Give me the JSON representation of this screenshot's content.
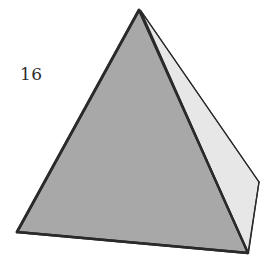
{
  "figure": {
    "kind": "geometry-solid-illustration",
    "shape_name": "tetrahedron",
    "label": "16",
    "label_position": {
      "x": 20,
      "y": 66
    },
    "canvas": {
      "width": 279,
      "height": 257,
      "background": "#ffffff"
    },
    "colors": {
      "background": "#ffffff",
      "front_face_fill": "#a8a8a8",
      "right_face_fill": "#e7e7e7",
      "edge_stroke": "#2a2a2a",
      "label_color": "#2b2b2b"
    },
    "vertices": {
      "apex": {
        "name": "apex",
        "x": 139,
        "y": 10
      },
      "bottom_left": {
        "name": "bottom-left",
        "x": 17,
        "y": 232
      },
      "bottom_front": {
        "name": "bottom-front",
        "x": 248,
        "y": 253
      },
      "right": {
        "name": "right",
        "x": 259,
        "y": 182
      }
    },
    "faces": [
      {
        "name": "front-face",
        "fill": "#a8a8a8",
        "points": "139,10 17,232 248,253",
        "stroke_width": 2.4
      },
      {
        "name": "right-face",
        "fill": "#e7e7e7",
        "points": "141,11 248,253 259,182",
        "stroke_width": 1.4
      }
    ],
    "edges": [
      {
        "name": "edge-apex-to-bottom-left",
        "x1": 139,
        "y1": 10,
        "x2": 17,
        "y2": 232,
        "width": 2.6
      },
      {
        "name": "edge-bottom-left-to-bottom-front",
        "x1": 17,
        "y1": 232,
        "x2": 248,
        "y2": 253,
        "width": 2.4
      },
      {
        "name": "edge-apex-to-bottom-front",
        "x1": 139,
        "y1": 10,
        "x2": 248,
        "y2": 253,
        "width": 2.2
      },
      {
        "name": "edge-apex-to-right",
        "x1": 141,
        "y1": 11,
        "x2": 259,
        "y2": 182,
        "width": 1.3
      },
      {
        "name": "edge-right-to-bottom-front",
        "x1": 259,
        "y1": 182,
        "x2": 248,
        "y2": 253,
        "width": 1.3
      }
    ]
  }
}
